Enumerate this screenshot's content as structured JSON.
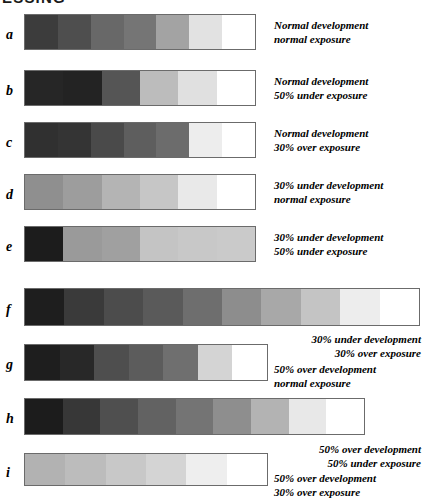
{
  "page": {
    "title_partial": "ESSING",
    "background": "#ffffff",
    "border_color": "#6b6b6b"
  },
  "chart_data": {
    "type": "heatmap",
    "title": "ESSING",
    "xlabel": "",
    "ylabel": "",
    "value_unit": "grayscale hex",
    "categories": [
      "a",
      "b",
      "c",
      "d",
      "e",
      "f",
      "g",
      "h",
      "i"
    ],
    "rows": [
      {
        "letter": "a",
        "caption_line1": "Normal development",
        "caption_line2": "normal exposure",
        "caption_align": "left",
        "steps": [
          "#3c3c3c",
          "#4e4e4e",
          "#686868",
          "#757575",
          "#a3a3a3",
          "#e2e2e2",
          "#ffffff"
        ],
        "top": 14,
        "left": 24,
        "width": 232,
        "height": 36,
        "letter_top": 28,
        "caption_left": 274,
        "caption_top": 19
      },
      {
        "letter": "b",
        "caption_line1": "Normal development",
        "caption_line2": "50% under exposure",
        "caption_align": "left",
        "steps": [
          "#262626",
          "#232323",
          "#555555",
          "#bcbcbc",
          "#e0e0e0",
          "#ffffff"
        ],
        "top": 70,
        "left": 24,
        "width": 232,
        "height": 36,
        "letter_top": 84,
        "caption_left": 274,
        "caption_top": 75
      },
      {
        "letter": "c",
        "caption_line1": "Normal development",
        "caption_line2": "30% over exposure",
        "caption_align": "left",
        "steps": [
          "#303030",
          "#343434",
          "#4a4a4a",
          "#5e5e5e",
          "#6c6c6c",
          "#ededed",
          "#ffffff"
        ],
        "top": 122,
        "left": 24,
        "width": 232,
        "height": 36,
        "letter_top": 136,
        "caption_left": 274,
        "caption_top": 127
      },
      {
        "letter": "d",
        "caption_line1": "30% under development",
        "caption_line2": "normal exposure",
        "caption_align": "left",
        "steps": [
          "#8f8f8f",
          "#9d9d9d",
          "#b4b4b4",
          "#c6c6c6",
          "#e9e9e9",
          "#ffffff"
        ],
        "top": 174,
        "left": 24,
        "width": 232,
        "height": 36,
        "letter_top": 188,
        "caption_left": 274,
        "caption_top": 179
      },
      {
        "letter": "e",
        "caption_line1": "30% under development",
        "caption_line2": "50% under exposure",
        "caption_align": "left",
        "steps": [
          "#1c1c1c",
          "#9a9a9a",
          "#a0a0a0",
          "#c4c4c4",
          "#c8c8c8",
          "#cacaca"
        ],
        "top": 226,
        "left": 24,
        "width": 232,
        "height": 36,
        "letter_top": 240,
        "caption_left": 274,
        "caption_top": 231
      },
      {
        "letter": "f",
        "caption_line1": "30% under development",
        "caption_line2": "30% over exposure",
        "caption_align": "right",
        "steps": [
          "#1e1e1e",
          "#3a3a3a",
          "#4c4c4c",
          "#5a5a5a",
          "#6e6e6e",
          "#8d8d8d",
          "#a8a8a8",
          "#c4c4c4",
          "#ededed",
          "#ffffff"
        ],
        "top": 288,
        "left": 24,
        "width": 396,
        "height": 38,
        "letter_top": 303,
        "caption_left": 255,
        "caption_top": 333
      },
      {
        "letter": "g",
        "caption_line1": "50% over development",
        "caption_line2": "normal exposure",
        "caption_align": "left",
        "steps": [
          "#1e1e1e",
          "#282828",
          "#4e4e4e",
          "#5c5c5c",
          "#6f6f6f",
          "#d4d4d4",
          "#ffffff"
        ],
        "top": 344,
        "left": 24,
        "width": 244,
        "height": 37,
        "letter_top": 358,
        "caption_left": 274,
        "caption_top": 363
      },
      {
        "letter": "h",
        "caption_line1": "50% over development",
        "caption_line2": "50% under exposure",
        "caption_align": "right",
        "steps": [
          "#1c1c1c",
          "#373737",
          "#4f4f4f",
          "#626262",
          "#747474",
          "#8e8e8e",
          "#b3b3b3",
          "#e8e8e8",
          "#ffffff"
        ],
        "top": 398,
        "left": 24,
        "width": 341,
        "height": 37,
        "letter_top": 412,
        "caption_left": 255,
        "caption_top": 443
      },
      {
        "letter": "i",
        "caption_line1": "50% over development",
        "caption_line2": "30% over exposure",
        "caption_align": "left",
        "steps": [
          "#b2b2b2",
          "#bcbcbc",
          "#c8c8c8",
          "#d4d4d4",
          "#eeeeee",
          "#ffffff"
        ],
        "top": 453,
        "left": 24,
        "width": 244,
        "height": 33,
        "letter_top": 466,
        "caption_left": 274,
        "caption_top": 472
      }
    ]
  }
}
